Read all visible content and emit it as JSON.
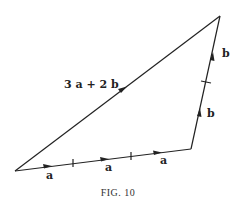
{
  "figure": {
    "caption": "FIG. 10",
    "vertices": {
      "bottom_left": [
        15,
        171
      ],
      "bottom_right": [
        191,
        149
      ],
      "top": [
        220,
        16
      ]
    },
    "labels": {
      "hypotenuse": "3 a + 2 b",
      "bottom_segments": [
        "a",
        "a",
        "a"
      ],
      "right_segments": [
        "b",
        "b"
      ]
    },
    "stroke_color": "#222222"
  }
}
